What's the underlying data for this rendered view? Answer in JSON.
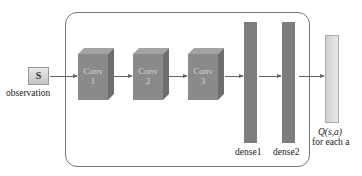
{
  "diagram": {
    "input": {
      "symbol": "S",
      "label": "observation"
    },
    "conv_layers": [
      {
        "name": "Conv",
        "index": "1"
      },
      {
        "name": "Conv",
        "index": "2"
      },
      {
        "name": "Conv",
        "index": "3"
      }
    ],
    "dense_layers": [
      {
        "label": "dense1"
      },
      {
        "label": "dense2"
      }
    ],
    "output": {
      "label_math": "Q(s,a)",
      "label_sub": "for each a"
    },
    "colors": {
      "conv": "#8a8a8a",
      "dense": "#7d7d7d",
      "output": "#dcdcdc",
      "frame": "#777777"
    }
  }
}
